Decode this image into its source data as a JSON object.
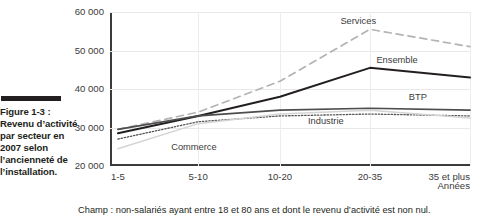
{
  "figure": {
    "caption_label": "Figure 1-3 :",
    "caption_body": "Revenu d’activité par secteur en 2007 selon l’ancienneté de l’installation.",
    "caption_full": "Figure 1-3 : Revenu d’activité par secteur en 2007 selon l’ancienneté de l’installation.",
    "footnote": "Champ : non-salariés ayant entre 18 et 80 ans et dont le revenu d’activité est non nul."
  },
  "chart_data": {
    "type": "line",
    "title": "",
    "subtitle": "",
    "xlabel": "Années",
    "ylabel": "",
    "categories": [
      "1-5",
      "5-10",
      "10-20",
      "20-35",
      "35 et plus"
    ],
    "ylim": [
      20000,
      60000
    ],
    "ytick_labels": [
      "20 000",
      "30 000",
      "40 000",
      "50 000",
      "60 000"
    ],
    "ytick_values": [
      20000,
      30000,
      40000,
      50000,
      60000
    ],
    "grid": true,
    "legend_position": "inline-annotations",
    "series": [
      {
        "name": "Services",
        "values": [
          29500,
          34000,
          42000,
          55500,
          51000
        ],
        "style": "dashed",
        "color": "#b3b3b3",
        "width": 1.7
      },
      {
        "name": "Ensemble",
        "values": [
          28500,
          33000,
          38000,
          45500,
          43000
        ],
        "style": "solid",
        "color": "#231f20",
        "width": 2.0
      },
      {
        "name": "BTP",
        "values": [
          29500,
          33000,
          34500,
          35000,
          34500
        ],
        "style": "solid",
        "color": "#4d4d4d",
        "width": 1.7
      },
      {
        "name": "Industrie",
        "values": [
          27000,
          31500,
          33000,
          33500,
          33000
        ],
        "style": "dotted",
        "color": "#555555",
        "width": 1.3
      },
      {
        "name": "Commerce",
        "values": [
          24500,
          31000,
          33500,
          34500,
          32500
        ],
        "style": "solid",
        "color": "#d4d4d4",
        "width": 1.5
      }
    ],
    "annotations": [
      {
        "text": "Services",
        "x_pct": 64.0,
        "y_val": 57500
      },
      {
        "text": "Ensemble",
        "x_pct": 74.0,
        "y_val": 47200
      },
      {
        "text": "BTP",
        "x_pct": 83.0,
        "y_val": 37600
      },
      {
        "text": "Industrie",
        "x_pct": 55.0,
        "y_val": 31400
      },
      {
        "text": "Commerce",
        "x_pct": 17.0,
        "y_val": 24600
      }
    ]
  },
  "colors": {
    "axis": "#3b3b3b",
    "grid": "#e8e8e8",
    "text": "#231f20"
  }
}
